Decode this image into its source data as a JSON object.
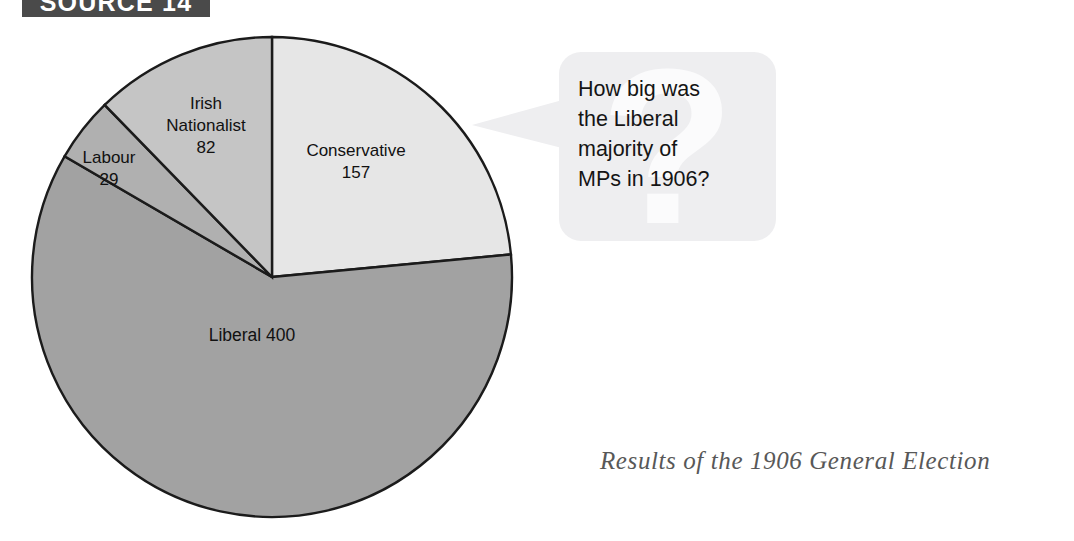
{
  "source_tab": {
    "label": "SOURCE 14"
  },
  "speech_bubble": {
    "watermark": "?",
    "lines": [
      "How big was",
      "the Liberal",
      "majority of",
      "MPs in 1906?"
    ],
    "question_full": "How big was the Liberal majority of MPs in 1906?"
  },
  "caption": "Results of the 1906 General Election",
  "chart_data": {
    "type": "pie",
    "title": "Results of the 1906 General Election",
    "total": 668,
    "unit": "MPs (seats)",
    "start_angle_deg": 0,
    "direction": "clockwise",
    "legend": "none (slices labelled in place)",
    "grid": false,
    "labels": [
      "Conservative",
      "Liberal",
      "Labour",
      "Irish Nationalist"
    ],
    "values": [
      157,
      400,
      29,
      82
    ],
    "colors": [
      "#e6e6e6",
      "#a2a2a2",
      "#b0b0b0",
      "#c5c5c5"
    ],
    "slices": [
      {
        "name": "Conservative",
        "value": 157,
        "label_lines": [
          "Conservative",
          "157"
        ],
        "color": "#e6e6e6",
        "start_deg": 0,
        "sweep_deg": 84.6,
        "label_x": 356,
        "label_y": 152
      },
      {
        "name": "Liberal",
        "value": 400,
        "label_lines": [
          "Liberal 400"
        ],
        "color": "#a2a2a2",
        "start_deg": 84.6,
        "sweep_deg": 215.6,
        "label_x": 252,
        "label_y": 336
      },
      {
        "name": "Labour",
        "value": 29,
        "label_lines": [
          "Labour",
          "29"
        ],
        "color": "#b0b0b0",
        "start_deg": 300.2,
        "sweep_deg": 15.6,
        "label_x": 109,
        "label_y": 159
      },
      {
        "name": "Irish Nationalist",
        "value": 82,
        "label_lines": [
          "Irish",
          "Nationalist",
          "82"
        ],
        "color": "#c5c5c5",
        "start_deg": 315.8,
        "sweep_deg": 44.2,
        "label_x": 206,
        "label_y": 105
      }
    ],
    "geometry": {
      "center_x": 272,
      "center_y": 277,
      "radius": 240
    }
  }
}
